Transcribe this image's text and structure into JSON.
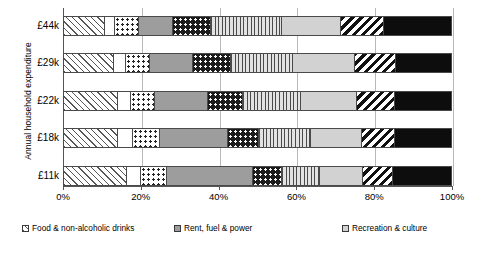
{
  "chart_data": {
    "type": "bar",
    "orientation": "horizontal",
    "stacked": true,
    "stacked_percent": true,
    "title": "",
    "xlabel": "",
    "ylabel": "Annual household expenditure",
    "xlim": [
      0,
      100
    ],
    "grid": true,
    "legend_position": "bottom",
    "xtick_labels": [
      "0%",
      "20%",
      "40%",
      "60%",
      "80%",
      "100%"
    ],
    "xtick_values": [
      0,
      20,
      40,
      60,
      80,
      100
    ],
    "categories": [
      "£44k",
      "£29k",
      "£22k",
      "£18k",
      "£11k"
    ],
    "series": [
      {
        "name": "Food & non-alcoholic drinks",
        "key": "food",
        "pattern": "diagonal-hatch-light",
        "values": [
          10.3,
          12.7,
          13.7,
          13.7,
          16.0
        ]
      },
      {
        "name": "Alcoholic drinks, tobacco & narcotics",
        "key": "alcohol",
        "pattern": "white",
        "values": [
          2.6,
          3.1,
          3.4,
          3.9,
          3.6
        ]
      },
      {
        "name": "Clothing & footwear",
        "key": "clothing",
        "pattern": "dotted-light",
        "values": [
          6.2,
          6.2,
          6.2,
          6.9,
          6.8
        ]
      },
      {
        "name": "Rent, fuel & power",
        "key": "rent",
        "pattern": "solid-mid-grey",
        "values": [
          8.8,
          11.1,
          13.7,
          17.6,
          22.2
        ]
      },
      {
        "name": "Household goods & services",
        "key": "household",
        "pattern": "dotted-dark",
        "values": [
          9.8,
          9.7,
          9.0,
          8.0,
          7.5
        ]
      },
      {
        "name": "Transport",
        "key": "transport",
        "pattern": "vertical-stripes",
        "values": [
          18.4,
          16.1,
          15.0,
          13.4,
          9.8
        ]
      },
      {
        "name": "Recreation & culture",
        "key": "recreation",
        "pattern": "solid-light-grey",
        "values": [
          15.2,
          16.0,
          14.5,
          13.2,
          11.1
        ]
      },
      {
        "name": "Restaurants & hotels",
        "key": "restaurants",
        "pattern": "diagonal-hatch-bold",
        "values": [
          11.1,
          10.6,
          9.8,
          8.5,
          7.8
        ]
      },
      {
        "name": "Miscellaneous goods & services",
        "key": "misc",
        "pattern": "solid-black",
        "values": [
          17.6,
          14.5,
          14.7,
          14.8,
          15.2
        ]
      }
    ]
  },
  "legend": {
    "entries": [
      {
        "label": "Food & non-alcoholic drinks",
        "key": "food"
      },
      {
        "label": "Rent, fuel & power",
        "key": "rent"
      },
      {
        "label": "Recreation & culture",
        "key": "recreation"
      },
      {
        "label": "Alcoholic drinks, tobacco & narcotics",
        "key": "alcohol"
      },
      {
        "label": "Household goods & services",
        "key": "household"
      },
      {
        "label": "Restaurants & hotels",
        "key": "restaurants"
      },
      {
        "label": "Clothing & footwear",
        "key": "clothing"
      },
      {
        "label": "Transport",
        "key": "transport"
      },
      {
        "label": "Miscellaneous goods & services",
        "key": "misc"
      }
    ]
  },
  "colors": {
    "axis": "#555555",
    "gridline": "#b8b8b8",
    "mid_grey": "#9d9d9d",
    "light_grey": "#d2d2d2",
    "black": "#0d0d0d",
    "white": "#ffffff"
  }
}
